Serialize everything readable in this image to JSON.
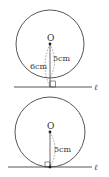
{
  "figures": [
    {
      "id": "line-outside-circle",
      "center_label": "O",
      "radius_label": "5cm",
      "distance_label": "6cm",
      "line_label": "ℓ",
      "relation": "line does not meet circle (distance 6cm > radius 5cm)"
    },
    {
      "id": "line-tangent-circle",
      "center_label": "O",
      "radius_label": "5cm",
      "line_label": "ℓ",
      "relation": "line tangent to circle (distance = radius 5cm)"
    }
  ],
  "colors": {
    "stroke": "#444444",
    "text": "#333333",
    "background": "#ffffff"
  }
}
